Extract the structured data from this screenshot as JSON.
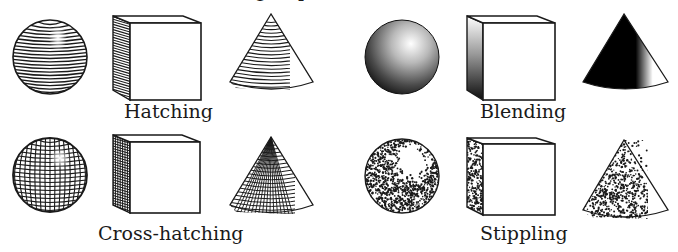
{
  "title_fragment": {
    "chars": [
      "g",
      "p"
    ],
    "note_visible": "clipped descenders only"
  },
  "colors": {
    "ink": "#1a1a1a",
    "paper": "#ffffff"
  },
  "panels": [
    {
      "id": "hatching",
      "label": "Hatching",
      "technique": "hatching",
      "shapes": [
        "sphere",
        "cube",
        "cone"
      ]
    },
    {
      "id": "blending",
      "label": "Blending",
      "technique": "blending",
      "shapes": [
        "sphere",
        "cube",
        "cone"
      ]
    },
    {
      "id": "cross-hatching",
      "label": "Cross-hatching",
      "technique": "cross-hatching",
      "shapes": [
        "sphere",
        "cube",
        "cone"
      ]
    },
    {
      "id": "stippling",
      "label": "Stippling",
      "technique": "stippling",
      "shapes": [
        "sphere",
        "cube",
        "cone"
      ]
    }
  ]
}
